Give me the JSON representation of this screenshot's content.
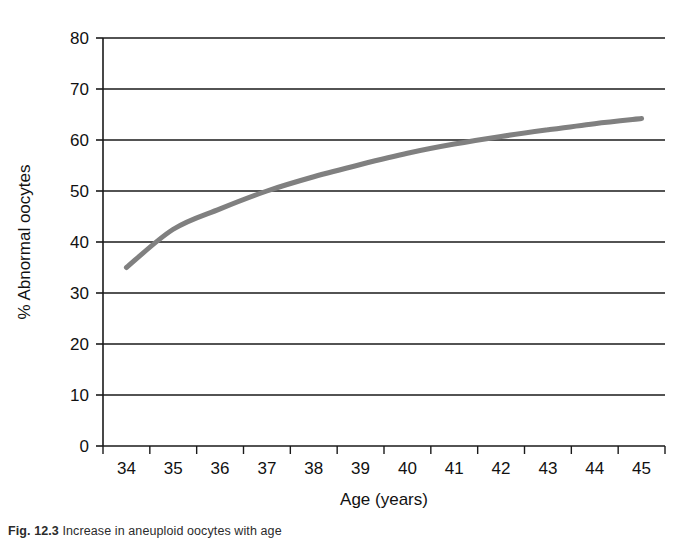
{
  "figure": {
    "caption_label": "Fig. 12.3",
    "caption_text": "Increase in aneuploid oocytes with age"
  },
  "chart_data": {
    "type": "line",
    "title": "",
    "xlabel": "Age (years)",
    "ylabel": "% Abnormal oocytes",
    "xlim": [
      33.5,
      45.5
    ],
    "ylim": [
      0,
      80
    ],
    "ytick_labels": [
      "0",
      "10",
      "20",
      "30",
      "40",
      "50",
      "60",
      "70",
      "80"
    ],
    "yticks": [
      0,
      10,
      20,
      30,
      40,
      50,
      60,
      70,
      80
    ],
    "xtick_labels": [
      "34",
      "35",
      "36",
      "37",
      "38",
      "39",
      "40",
      "41",
      "42",
      "43",
      "44",
      "45"
    ],
    "categories": [
      34,
      35,
      36,
      37,
      38,
      39,
      40,
      41,
      42,
      43,
      44,
      45
    ],
    "values": [
      35,
      42.5,
      46.5,
      50,
      52.8,
      55.2,
      57.4,
      59.2,
      60.7,
      62,
      63.2,
      64.2
    ],
    "grid": "horizontal",
    "legend": "none",
    "series_name": "Abnormal oocytes",
    "line_color": "#808080",
    "axis_color": "#1a1a1a",
    "grid_color": "#1a1a1a",
    "line_width": 5
  }
}
